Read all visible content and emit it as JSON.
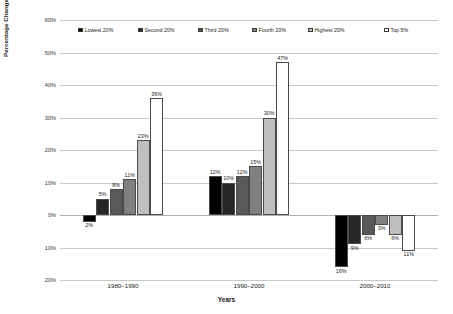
{
  "chart_data": {
    "type": "bar",
    "title": "",
    "xlabel": "Years",
    "ylabel": "Percentage Change",
    "categories": [
      "1980–1990",
      "1990–2000",
      "2000–2010"
    ],
    "ylim": [
      -20,
      60
    ],
    "yticks": [
      60,
      50,
      40,
      30,
      20,
      10,
      0,
      -10,
      -20
    ],
    "ytick_labels": [
      "60%",
      "50%",
      "40%",
      "30%",
      "20%",
      "10%",
      "0%",
      "10%",
      "20%"
    ],
    "grid": true,
    "legend_position": "top-inside",
    "series": [
      {
        "name": "Lowest 20%",
        "color": "#000000",
        "values": [
          -2,
          12,
          -16
        ],
        "labels": [
          "2%",
          "12%",
          "16%"
        ]
      },
      {
        "name": "Second 20%",
        "color": "#262626",
        "values": [
          5,
          10,
          -9
        ],
        "labels": [
          "5%",
          "10%",
          "9%"
        ]
      },
      {
        "name": "Third 20%",
        "color": "#595959",
        "values": [
          8,
          12,
          -6
        ],
        "labels": [
          "8%",
          "12%",
          "6%"
        ]
      },
      {
        "name": "Fourth 20%",
        "color": "#808080",
        "values": [
          11,
          15,
          -3
        ],
        "labels": [
          "11%",
          "15%",
          "3%"
        ]
      },
      {
        "name": "Highest 20%",
        "color": "#bfbfbf",
        "values": [
          23,
          30,
          -6
        ],
        "labels": [
          "23%",
          "30%",
          "6%"
        ]
      },
      {
        "name": "Top 5%",
        "color": "#ffffff",
        "values": [
          36,
          47,
          -11
        ],
        "labels": [
          "36%",
          "47%",
          "11%"
        ]
      }
    ]
  }
}
